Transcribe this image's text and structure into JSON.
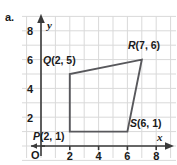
{
  "part_label": "a.",
  "axes": {
    "x_name": "x",
    "y_name": "y",
    "origin_label": "O",
    "x_ticks": [
      "2",
      "4",
      "6",
      "8"
    ],
    "y_ticks": [
      "2",
      "4",
      "6",
      "8"
    ],
    "x_tick_values": [
      2,
      4,
      6,
      8
    ],
    "y_tick_values": [
      2,
      4,
      6,
      8
    ],
    "xlim": [
      0,
      9
    ],
    "ylim": [
      0,
      9
    ],
    "grid": true,
    "grid_step": 1,
    "grid_color": "#d9d9d9",
    "axis_color": "#3a3a3a"
  },
  "shape": {
    "type": "quadrilateral",
    "stroke_color": "#58585c",
    "closed": true,
    "vertices": [
      {
        "name": "P",
        "x": 2,
        "y": 1,
        "label": "P(2, 1)"
      },
      {
        "name": "Q",
        "x": 2,
        "y": 5,
        "label": "Q(2, 5)"
      },
      {
        "name": "R",
        "x": 7,
        "y": 6,
        "label": "R(7, 6)"
      },
      {
        "name": "S",
        "x": 6,
        "y": 1,
        "label": "S(6, 1)"
      }
    ]
  },
  "labels": {
    "P": {
      "text": "P(2, 1)",
      "letter": "P",
      "coords": "(2, 1)"
    },
    "Q": {
      "text": "Q(2, 5)",
      "letter": "Q",
      "coords": "(2, 5)"
    },
    "R": {
      "text": "R(7, 6)",
      "letter": "R",
      "coords": "(7, 6)"
    },
    "S": {
      "text": "S(6, 1)",
      "letter": "S",
      "coords": "(6, 1)"
    }
  }
}
